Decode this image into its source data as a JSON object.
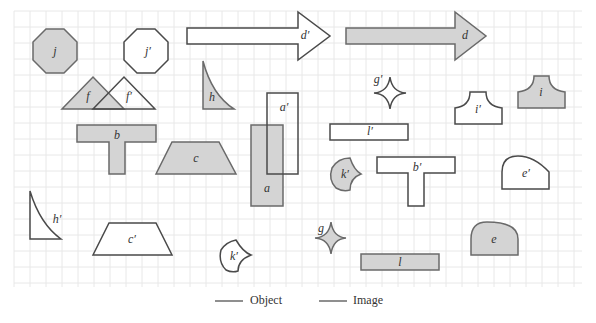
{
  "diagram": {
    "title": "",
    "grid": {
      "x0": 14,
      "y0": 11,
      "x1": 582,
      "y1": 287,
      "cell": 16,
      "color": "#e8e8e8"
    },
    "colors": {
      "object_fill": "#d4d4d4",
      "object_stroke": "#6a6a6a",
      "image_fill": "#ffffff",
      "image_stroke": "#4a4a4a"
    },
    "shapes": [
      {
        "id": "j",
        "label": "j",
        "role": "object",
        "kind": "octagon"
      },
      {
        "id": "j_prime",
        "label": "j′",
        "role": "image",
        "kind": "octagon"
      },
      {
        "id": "d_prime",
        "label": "d′",
        "role": "image",
        "kind": "arrow"
      },
      {
        "id": "d",
        "label": "d",
        "role": "object",
        "kind": "arrow"
      },
      {
        "id": "f",
        "label": "f",
        "role": "object",
        "kind": "triangle"
      },
      {
        "id": "f_prime",
        "label": "f′",
        "role": "image",
        "kind": "triangle"
      },
      {
        "id": "h",
        "label": "h",
        "role": "object",
        "kind": "curved-triangle"
      },
      {
        "id": "g_prime",
        "label": "g′",
        "role": "image",
        "kind": "astroid"
      },
      {
        "id": "i_prime",
        "label": "i′",
        "role": "image",
        "kind": "concave-pedestal"
      },
      {
        "id": "i",
        "label": "i",
        "role": "object",
        "kind": "concave-pedestal"
      },
      {
        "id": "a_prime",
        "label": "a′",
        "role": "image",
        "kind": "rectangle"
      },
      {
        "id": "a",
        "label": "a",
        "role": "object",
        "kind": "rectangle"
      },
      {
        "id": "b",
        "label": "b",
        "role": "object",
        "kind": "t-shape"
      },
      {
        "id": "c",
        "label": "c",
        "role": "object",
        "kind": "trapezoid"
      },
      {
        "id": "l_prime",
        "label": "l′",
        "role": "image",
        "kind": "rectangle"
      },
      {
        "id": "k_prime_obj",
        "label": "k′",
        "role": "object",
        "kind": "curved-sector"
      },
      {
        "id": "b_prime",
        "label": "b′",
        "role": "image",
        "kind": "t-shape"
      },
      {
        "id": "e_prime",
        "label": "e′",
        "role": "image",
        "kind": "semicircle-cap"
      },
      {
        "id": "h_prime",
        "label": "h′",
        "role": "image",
        "kind": "curved-triangle"
      },
      {
        "id": "c_prime",
        "label": "c′",
        "role": "image",
        "kind": "trapezoid"
      },
      {
        "id": "k_prime",
        "label": "k′",
        "role": "image",
        "kind": "curved-sector"
      },
      {
        "id": "g",
        "label": "g",
        "role": "object",
        "kind": "astroid"
      },
      {
        "id": "l",
        "label": "l",
        "role": "object",
        "kind": "rectangle"
      },
      {
        "id": "e",
        "label": "e",
        "role": "object",
        "kind": "semicircle-cap"
      }
    ]
  },
  "legend": {
    "object_label": "Object",
    "image_label": "Image"
  }
}
